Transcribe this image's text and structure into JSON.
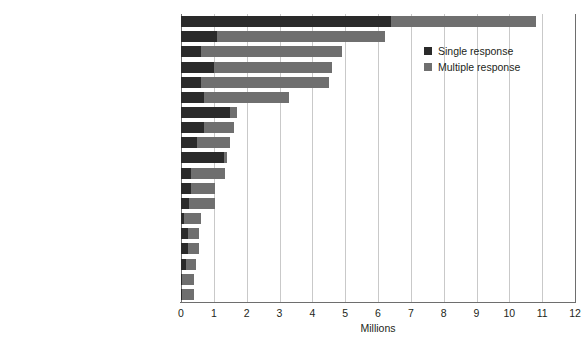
{
  "chart_data": {
    "type": "bar",
    "orientation": "horizontal",
    "stacked": true,
    "title": "",
    "xlabel": "Millions",
    "ylabel": "",
    "xlim": [
      0,
      12
    ],
    "xticks": [
      0,
      1,
      2,
      3,
      4,
      5,
      6,
      7,
      8,
      9,
      10,
      11,
      12
    ],
    "grid": true,
    "legend_position": "top-right",
    "colors": {
      "single": "#2a2a2a",
      "multiple": "#6f6f6f",
      "gridline": "#c9c9c9",
      "axis": "#6e6e6e",
      "text": "#231f20",
      "background": "#ffffff"
    },
    "categories": [
      "Canadian",
      "English",
      "Scottish",
      "French",
      "Irish",
      "German",
      "Chinese",
      "Italian",
      "First Nations (North American Indian)",
      "East Indian",
      "Ukrainian",
      "Dutch",
      "Polish",
      "British Isles origins, n.i.e.",
      "Russian",
      "Métis",
      "Portuguese",
      "Welsh",
      "Norwegian"
    ],
    "series": [
      {
        "name": "Single response",
        "values": [
          6.4,
          1.1,
          0.6,
          1.0,
          0.6,
          0.7,
          1.5,
          0.7,
          0.5,
          1.3,
          0.3,
          0.3,
          0.25,
          0.1,
          0.2,
          0.2,
          0.15,
          0.03,
          0.02
        ]
      },
      {
        "name": "Multiple response",
        "values": [
          4.4,
          5.1,
          4.3,
          3.6,
          3.9,
          2.6,
          0.2,
          0.9,
          1.0,
          0.1,
          1.05,
          0.75,
          0.8,
          0.5,
          0.35,
          0.35,
          0.3,
          0.37,
          0.38
        ]
      }
    ],
    "totals": [
      10.8,
      6.2,
      4.9,
      4.6,
      4.5,
      3.3,
      1.7,
      1.6,
      1.5,
      1.4,
      1.35,
      1.05,
      1.05,
      0.6,
      0.55,
      0.55,
      0.45,
      0.4,
      0.4
    ],
    "footnote_marker": "1"
  },
  "legend": {
    "items": [
      {
        "label": "Single response",
        "swatch": "single"
      },
      {
        "label": "Multiple response",
        "swatch": "multiple"
      }
    ]
  },
  "axis": {
    "x_title": "Millions"
  }
}
